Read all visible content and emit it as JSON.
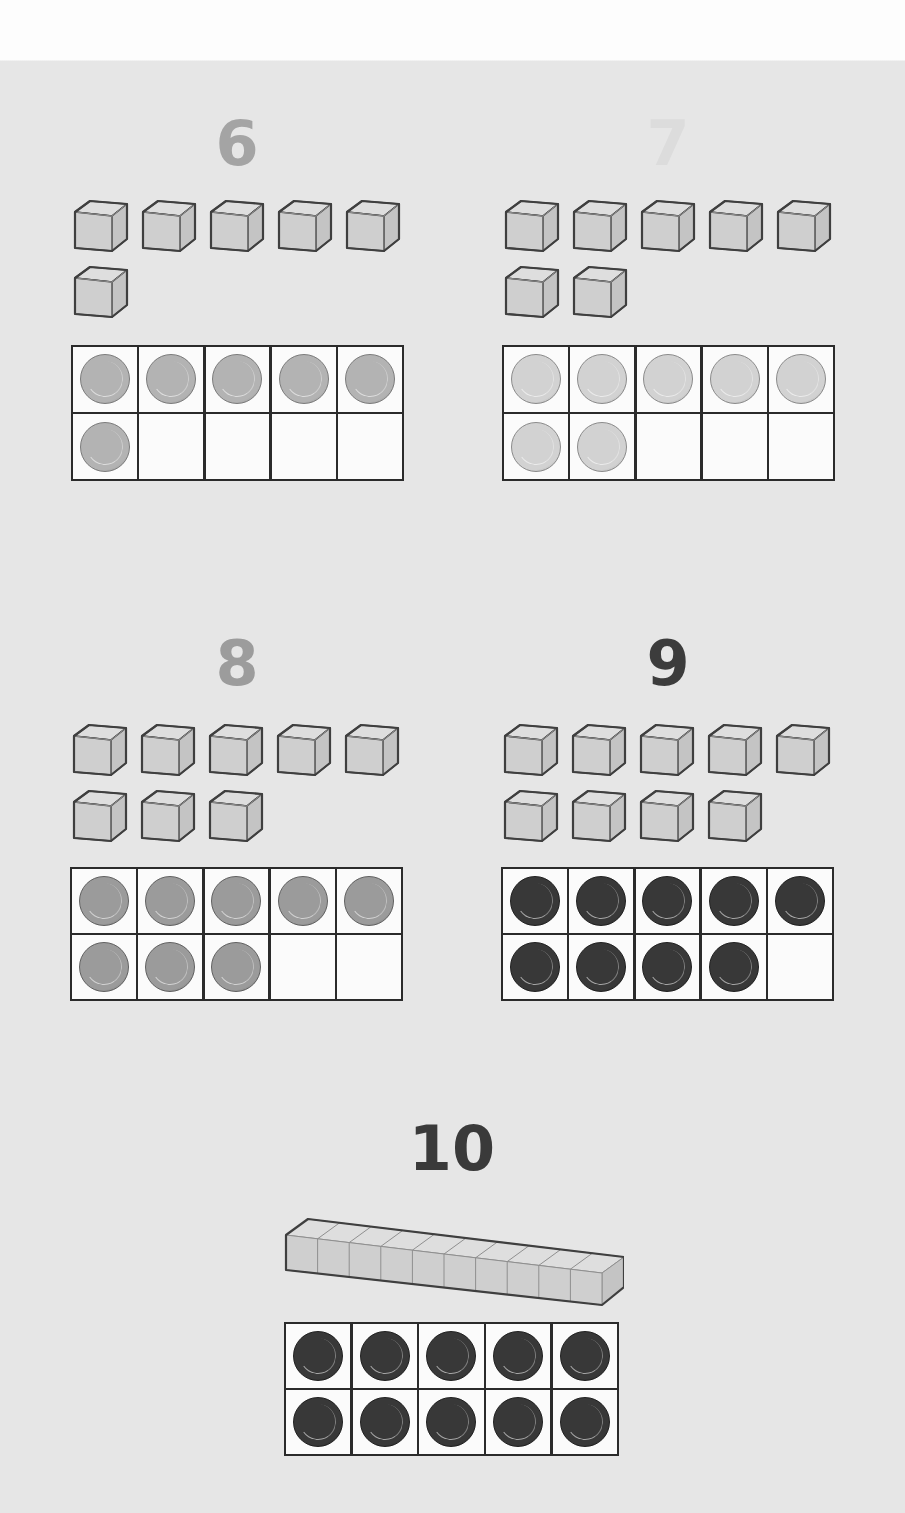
{
  "groups": [
    {
      "id": "six",
      "numeral": "6",
      "count": 6,
      "numeral_color": "#a4a4a4",
      "counter_color": "#b3b3b3",
      "counter_border": "#7a7a7a",
      "numeral_pos": [
        177,
        113
      ],
      "cubes_pos": [
        72,
        198
      ],
      "frame_pos": [
        71,
        345,
        333,
        136
      ],
      "representation": "cubes"
    },
    {
      "id": "seven",
      "numeral": "7",
      "count": 7,
      "numeral_color": "#dcdcdc",
      "counter_color": "#d2d2d2",
      "counter_border": "#8a8a8a",
      "numeral_pos": [
        608,
        113
      ],
      "cubes_pos": [
        503,
        198
      ],
      "frame_pos": [
        502,
        345,
        333,
        136
      ],
      "representation": "cubes"
    },
    {
      "id": "eight",
      "numeral": "8",
      "count": 8,
      "numeral_color": "#9c9c9c",
      "counter_color": "#9b9b9b",
      "counter_border": "#5f5f5f",
      "numeral_pos": [
        177,
        633
      ],
      "cubes_pos": [
        71,
        722
      ],
      "frame_pos": [
        70,
        867,
        333,
        134
      ],
      "representation": "cubes"
    },
    {
      "id": "nine",
      "numeral": "9",
      "count": 9,
      "numeral_color": "#3c3c3c",
      "counter_color": "#383838",
      "counter_border": "#1e1e1e",
      "numeral_pos": [
        608,
        633
      ],
      "cubes_pos": [
        502,
        722
      ],
      "frame_pos": [
        501,
        867,
        333,
        134
      ],
      "representation": "cubes"
    },
    {
      "id": "ten",
      "numeral": "10",
      "count": 10,
      "numeral_color": "#3a3a3a",
      "counter_color": "#383838",
      "counter_border": "#1e1e1e",
      "numeral_pos": [
        392,
        1118
      ],
      "rod_pos": [
        284,
        1205
      ],
      "frame_pos": [
        284,
        1322,
        335,
        134
      ],
      "representation": "rod"
    }
  ],
  "cube_style": {
    "front": "#cfcfcf",
    "top": "#dedede",
    "side": "#c4c4c4",
    "stroke": "#3f3f3f",
    "inner": "#8f8f8f"
  },
  "frame_slots": 10
}
